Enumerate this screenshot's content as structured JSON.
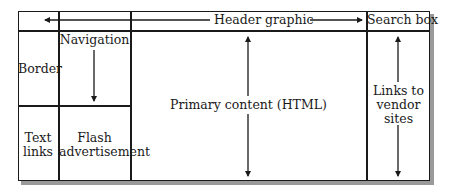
{
  "diagram": {
    "regions": {
      "header": {
        "label": "Header graphic"
      },
      "search": {
        "label": "Search box"
      },
      "border": {
        "label": "Border"
      },
      "navigation": {
        "label": "Navigation"
      },
      "text_links": {
        "line1": "Text",
        "line2": "links"
      },
      "flash_ad": {
        "line1": "Flash",
        "line2": "advertisement"
      },
      "primary": {
        "label": "Primary content (HTML)"
      },
      "vendor_links": {
        "line1": "Links to",
        "line2": "vendor",
        "line3": "sites"
      }
    },
    "arrows": {
      "header": "horizontal double-headed, spans header row width",
      "navigation": "down arrow from Navigation label",
      "primary": "vertical double-headed, spans content column height",
      "vendor_links": "vertical double-headed, spans right column height"
    },
    "colors": {
      "line": "#1a1a1a",
      "shadow": "#9a9a9a",
      "background": "#ffffff"
    }
  }
}
